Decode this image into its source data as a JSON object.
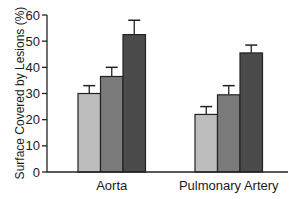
{
  "chart_data": {
    "type": "bar",
    "title": "",
    "xlabel": "",
    "ylabel": "Surface Covered by Lesions (%)",
    "ylim": [
      0,
      60
    ],
    "yticks": [
      0,
      10,
      20,
      30,
      40,
      50,
      60
    ],
    "grid": false,
    "legend": null,
    "categories": [
      "Aorta",
      "Pulmonary Artery"
    ],
    "series": [
      {
        "name": "Group 1",
        "color": "#bdbdbd",
        "values": [
          30,
          22
        ],
        "errors": [
          3,
          3
        ]
      },
      {
        "name": "Group 2",
        "color": "#7b7b7b",
        "values": [
          36.5,
          29.5
        ],
        "errors": [
          3.5,
          3.5
        ]
      },
      {
        "name": "Group 3",
        "color": "#4b4b4b",
        "values": [
          52.5,
          45.5
        ],
        "errors": [
          5.5,
          3
        ]
      }
    ]
  },
  "labels": {
    "y_title": "Surface Covered by Lesions (%)",
    "categories": [
      "Aorta",
      "Pulmonary Artery"
    ],
    "yticks": [
      "0",
      "10",
      "20",
      "30",
      "40",
      "50",
      "60"
    ]
  }
}
